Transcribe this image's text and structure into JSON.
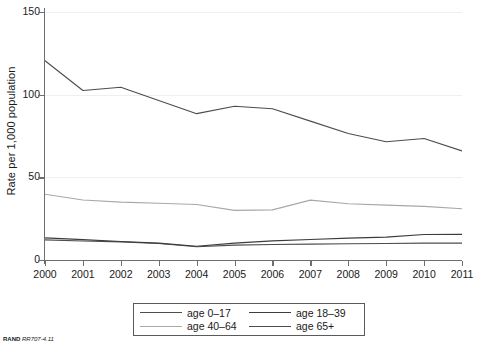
{
  "chart_data": {
    "type": "line",
    "title": "",
    "xlabel": "",
    "ylabel": "Rate per 1,000 population",
    "x": [
      2000,
      2001,
      2002,
      2003,
      2004,
      2005,
      2006,
      2007,
      2008,
      2009,
      2010,
      2011
    ],
    "xticklabels": [
      "2000",
      "2001",
      "2002",
      "2003",
      "2004",
      "2005",
      "2006",
      "2007",
      "2008",
      "2009",
      "2010",
      "2011"
    ],
    "yticklabels": [
      "0",
      "50",
      "100",
      "150"
    ],
    "yticks": [
      0,
      50,
      100,
      150
    ],
    "ylim": [
      0,
      150
    ],
    "xlim": [
      2000,
      2011
    ],
    "grid": "horizontal-faint",
    "legend_position": "below-center",
    "series": [
      {
        "name": "age 0-17",
        "label": "age 0–17",
        "color": "#4d4d4d",
        "values": [
          12.2,
          11.5,
          11.0,
          10.0,
          8.0,
          9.0,
          9.4,
          9.6,
          9.8,
          10.0,
          10.2,
          10.2
        ]
      },
      {
        "name": "age 18-39",
        "label": "age 18–39",
        "color": "#3c3c3c",
        "values": [
          13.4,
          12.3,
          11.2,
          10.2,
          8.3,
          10.2,
          11.6,
          12.4,
          13.2,
          13.8,
          15.4,
          15.5
        ]
      },
      {
        "name": "age 40-64",
        "label": "age 40–64",
        "color": "#a8a8a8",
        "values": [
          39.8,
          36.3,
          35.0,
          34.3,
          33.6,
          30.0,
          30.3,
          36.2,
          34.0,
          33.2,
          32.4,
          31.0
        ]
      },
      {
        "name": "age 65+",
        "label": "age 65+",
        "color": "#4d4d4d",
        "values": [
          120.5,
          102.5,
          104.5,
          96.5,
          88.5,
          93.0,
          91.5,
          84.0,
          76.5,
          71.5,
          73.5,
          66.0
        ]
      }
    ]
  },
  "legend": {
    "entries": [
      {
        "label": "age 0–17",
        "color": "#4d4d4d"
      },
      {
        "label": "age 18–39",
        "color": "#3c3c3c"
      },
      {
        "label": "age 40–64",
        "color": "#a8a8a8"
      },
      {
        "label": "age 65+",
        "color": "#4d4d4d"
      }
    ]
  },
  "footer": {
    "brand": "RAND",
    "code": "RR707-4.11"
  }
}
